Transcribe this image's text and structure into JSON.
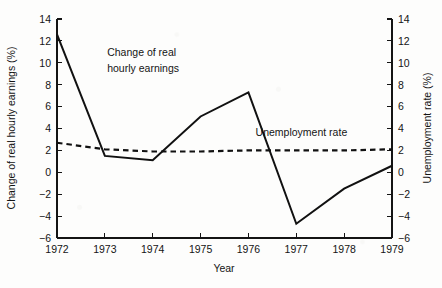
{
  "chart_data": {
    "type": "line",
    "title": "",
    "xlabel": "Year",
    "ylabel": "Change of real hourly earnings (%)",
    "y2label": "Unemployment rate (%)",
    "categories": [
      "1972",
      "1973",
      "1974",
      "1975",
      "1976",
      "1977",
      "1978",
      "1979"
    ],
    "x": [
      1972,
      1973,
      1974,
      1975,
      1976,
      1977,
      1978,
      1979
    ],
    "ylim": [
      -6,
      14
    ],
    "y2lim": [
      -6,
      14
    ],
    "yticks": [
      "14",
      "12",
      "10",
      "8",
      "6",
      "4",
      "2",
      "0",
      "-2",
      "-4",
      "-6"
    ],
    "ytick_values": [
      14,
      12,
      10,
      8,
      6,
      4,
      2,
      0,
      -2,
      -4,
      -6
    ],
    "y2ticks": [
      "14",
      "12",
      "10",
      "8",
      "6",
      "4",
      "2",
      "0",
      "-2",
      "-4",
      "-6"
    ],
    "y2tick_values": [
      14,
      12,
      10,
      8,
      6,
      4,
      2,
      0,
      -2,
      -4,
      -6
    ],
    "grid": false,
    "legend_position": "inline-annotations",
    "series": [
      {
        "name": "Change of real hourly earnings",
        "axis": "left",
        "style": "solid",
        "values": [
          12.6,
          1.5,
          1.1,
          5.1,
          7.3,
          -4.7,
          -1.5,
          0.6
        ]
      },
      {
        "name": "Unemployment rate",
        "axis": "right",
        "style": "dashed",
        "values": [
          2.7,
          2.1,
          1.9,
          1.9,
          2.0,
          2.0,
          2.0,
          2.1
        ]
      }
    ],
    "annotations": [
      {
        "text": "Change of real",
        "x": 1973.05,
        "y": 10.6
      },
      {
        "text": "hourly earnings",
        "x": 1973.05,
        "y": 9.2
      },
      {
        "text": "Unemployment rate",
        "x": 1976.15,
        "y": 3.3
      }
    ]
  },
  "colors": {
    "line": "#111111",
    "axis": "#141414",
    "background": "#fdfdfc"
  }
}
